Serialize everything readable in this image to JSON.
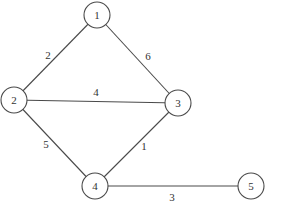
{
  "graph": {
    "title": "",
    "nodes": [
      {
        "id": "1",
        "label": "1"
      },
      {
        "id": "2",
        "label": "2"
      },
      {
        "id": "3",
        "label": "3"
      },
      {
        "id": "4",
        "label": "4"
      },
      {
        "id": "5",
        "label": "5"
      }
    ],
    "edges": [
      {
        "from": "1",
        "to": "2",
        "weight": "2"
      },
      {
        "from": "1",
        "to": "3",
        "weight": "6"
      },
      {
        "from": "2",
        "to": "3",
        "weight": "4"
      },
      {
        "from": "2",
        "to": "4",
        "weight": "5"
      },
      {
        "from": "3",
        "to": "4",
        "weight": "1"
      },
      {
        "from": "4",
        "to": "5",
        "weight": "3"
      }
    ]
  }
}
